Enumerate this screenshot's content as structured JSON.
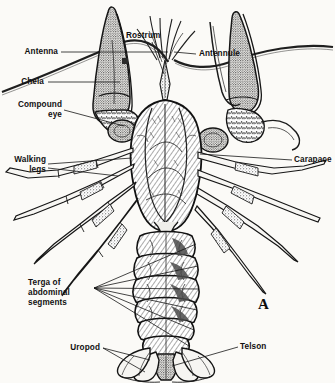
{
  "figure": {
    "plate_letter": "A",
    "background_color": "#fbfaf7",
    "ink_color": "#1a1a1a"
  },
  "labels": {
    "antenna": "Antenna",
    "chela": "Chela",
    "compound_eye_line1": "Compound",
    "compound_eye_line2": "eye",
    "walking_legs_line1": "Walking",
    "walking_legs_line2": "legs",
    "rostrum": "Rostrum",
    "antennule": "Antennule",
    "carapace": "Carapace",
    "terga_line1": "Terga of",
    "terga_line2": "abdominal",
    "terga_line3": "segments",
    "uropod": "Uropod",
    "telson": "Telson"
  },
  "parts": [
    {
      "name": "antenna",
      "side": "left",
      "count": 2
    },
    {
      "name": "chela",
      "side": "left",
      "count": 2
    },
    {
      "name": "compound-eye",
      "side": "left",
      "count": 2
    },
    {
      "name": "walking-legs",
      "side": "left",
      "count": 8
    },
    {
      "name": "rostrum",
      "side": "top",
      "count": 1
    },
    {
      "name": "antennule",
      "side": "right",
      "count": 2
    },
    {
      "name": "carapace",
      "side": "right",
      "count": 1
    },
    {
      "name": "terga-of-abdominal-segments",
      "side": "left",
      "count": 6
    },
    {
      "name": "uropod",
      "side": "bottom",
      "count": 4
    },
    {
      "name": "telson",
      "side": "bottom",
      "count": 1
    }
  ]
}
